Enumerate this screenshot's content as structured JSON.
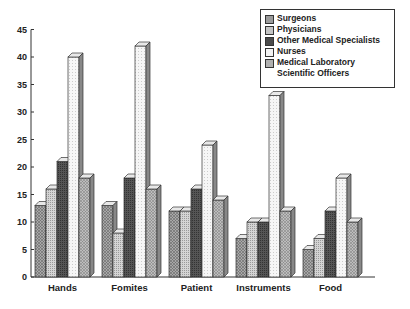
{
  "chart_data": {
    "type": "bar",
    "title": "",
    "xlabel": "",
    "ylabel": "",
    "ylim": [
      0,
      45
    ],
    "yticks": [
      0,
      5,
      10,
      15,
      20,
      25,
      30,
      35,
      40,
      45
    ],
    "grid": false,
    "legend_position": "top-right",
    "style": "3d",
    "categories": [
      "Hands",
      "Fomites",
      "Patient",
      "Instruments",
      "Food"
    ],
    "series": [
      {
        "name": "Surgeons",
        "values": [
          13,
          13,
          12,
          7,
          5
        ],
        "color": "#9a9a9a",
        "pattern": "crosshatch"
      },
      {
        "name": "Physicians",
        "values": [
          16,
          8,
          12,
          10,
          7
        ],
        "color": "#c4c4c4",
        "pattern": "dots"
      },
      {
        "name": "Other Medical Specialists",
        "values": [
          21,
          18,
          16,
          10,
          12
        ],
        "color": "#4a4a4a",
        "pattern": "dense"
      },
      {
        "name": "Nurses",
        "values": [
          40,
          42,
          24,
          33,
          18
        ],
        "color": "#f2f2f2",
        "pattern": "light"
      },
      {
        "name": "Medical Laboratory Scientific Officers",
        "values": [
          18,
          16,
          14,
          12,
          10
        ],
        "color": "#b0b0b0",
        "pattern": "crosshatch"
      }
    ]
  }
}
